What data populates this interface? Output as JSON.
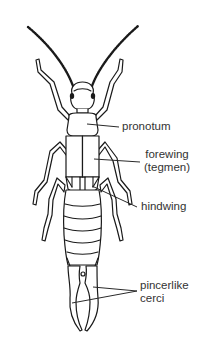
{
  "figure": {
    "view": "dorsal",
    "line_color": "#1a1a1a",
    "label_color": "#333333",
    "background": "#ffffff"
  },
  "labels": {
    "pronotum": "pronotum",
    "forewing_line1": "forewing",
    "forewing_line2": "(tegmen)",
    "hindwing": "hindwing",
    "cerci_line1": "pincerlike",
    "cerci_line2": "cerci"
  }
}
